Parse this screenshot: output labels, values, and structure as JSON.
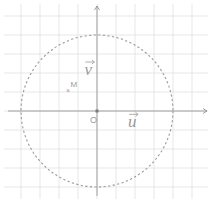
{
  "figure": {
    "width": 211,
    "height": 203,
    "origin_px": [
      97,
      111
    ],
    "unit_px": 19,
    "grid": {
      "x_min": -4,
      "x_max": 5,
      "y_min": -4,
      "y_max": 5,
      "color": "#e4e4e4"
    },
    "axes": {
      "color": "#8a8a8a",
      "x_range_px": [
        8,
        207
      ],
      "y_range_px": [
        196,
        6
      ]
    },
    "circle": {
      "center": [
        0,
        0
      ],
      "radius_units": 4,
      "style": "dashed",
      "color": "#9a9a9a"
    },
    "labels": {
      "origin": "O",
      "u": "u",
      "v": "v",
      "point": "M"
    },
    "point_M": {
      "x": -1.5,
      "y": 1.1,
      "marker": "×"
    },
    "vectors": {
      "u_label_pos": [
        1.9,
        -0.65
      ],
      "v_label_pos": [
        -0.4,
        2.0
      ]
    }
  }
}
